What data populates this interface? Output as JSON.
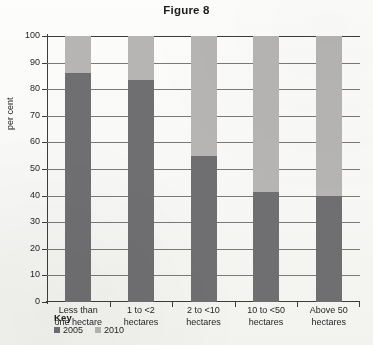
{
  "chart_data": {
    "type": "bar",
    "stacked": true,
    "title": "Figure 8",
    "xlabel": "",
    "ylabel": "per cent",
    "ylim": [
      0,
      100
    ],
    "ytick_step": 10,
    "yticks": [
      "100",
      "90",
      "80",
      "70",
      "60",
      "50",
      "40",
      "30",
      "20",
      "10",
      "0"
    ],
    "grid": true,
    "grid_axis": "y",
    "legend_position": "bottom-left",
    "legend_title": "Key",
    "categories": [
      "Less than one hectare",
      "1 to <2 hectares",
      "2 to <10 hectares",
      "10 to <50 hectares",
      "Above 50 hectares"
    ],
    "category_lines": [
      [
        "Less than",
        "one hectare"
      ],
      [
        "1 to <2",
        "hectares"
      ],
      [
        "2 to <10",
        "hectares"
      ],
      [
        "10 to <50",
        "hectares"
      ],
      [
        "Above 50",
        "hectares"
      ]
    ],
    "series": [
      {
        "name": "2005",
        "color": "#6f6e70",
        "values": [
          86,
          83.5,
          55,
          41.5,
          40
        ]
      },
      {
        "name": "2010",
        "color": "#b6b5b4",
        "values": [
          14,
          16.5,
          45,
          58.5,
          60
        ]
      }
    ]
  },
  "legend": {
    "title": "Key",
    "items": [
      {
        "label": "2005",
        "color": "#6f6e70"
      },
      {
        "label": "2010",
        "color": "#b6b5b4"
      }
    ]
  },
  "colors": {
    "series_2005": "#6f6e70",
    "series_2010": "#b6b5b4",
    "axis": "#3d3b3c",
    "grid": "#7b7879",
    "text": "#211f20",
    "background": "#fbfbfa"
  }
}
